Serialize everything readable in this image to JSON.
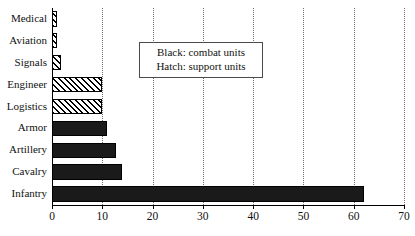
{
  "chart_data": {
    "type": "bar",
    "orientation": "horizontal",
    "title": "",
    "xlabel": "",
    "ylabel": "",
    "categories": [
      "Medical",
      "Aviation",
      "Signals",
      "Engineer",
      "Logistics",
      "Armor",
      "Artillery",
      "Cavalry",
      "Infantry"
    ],
    "values": [
      1,
      1,
      1.7,
      10,
      10,
      11,
      12.7,
      14,
      62
    ],
    "fill": [
      "hatch",
      "hatch",
      "hatch",
      "hatch",
      "hatch",
      "solid",
      "solid",
      "solid",
      "solid"
    ],
    "xlim": [
      0,
      70
    ],
    "xticks": [
      0,
      10,
      20,
      30,
      40,
      50,
      60,
      70
    ],
    "xticklabels": [
      "0",
      "10",
      "20",
      "30",
      "40",
      "50",
      "60",
      "70"
    ],
    "grid": "vertical-dotted",
    "legend": {
      "position": "upper-center",
      "entries": [
        "Black: combat units",
        "Hatch: support units"
      ]
    },
    "colors": {
      "solid": "#1a1a1a",
      "hatch_line": "#000000",
      "hatch_background": "#ffffff",
      "axis": "#000000",
      "gridline": "#6e6e6e",
      "text": "#111111",
      "plot_background": "#ffffff"
    }
  }
}
